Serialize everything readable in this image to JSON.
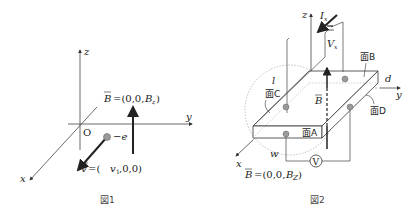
{
  "figure1": {
    "caption": "図1",
    "axes": {
      "x": "x",
      "y": "y",
      "z": "z",
      "origin": "O"
    },
    "field_label": "B=(0,0,B_z)",
    "field_text": "=(0,0,",
    "field_sym": "B",
    "field_sub": "z",
    "charge_label": "−e",
    "velocity_text": "=(",
    "velocity_sym": "v",
    "velocity_v1": "v",
    "velocity_sub": "1",
    "velocity_rest": ",0,0)"
  },
  "figure2": {
    "caption": "図2",
    "axes": {
      "x": "x",
      "y": "y",
      "z": "z",
      "origin": "O"
    },
    "current_label": "I",
    "current_sub": "x",
    "voltage_label": "V",
    "voltage_sub": "x",
    "dimensions": {
      "length": "l",
      "width": "w",
      "thickness": "d"
    },
    "faces": [
      "面A",
      "面B",
      "面C",
      "面D"
    ],
    "field_vec": "B",
    "voltmeter": "V",
    "field_eq_text": "=(0,0,",
    "field_eq_sym": "B",
    "field_eq_sub": "Z"
  },
  "colors": {
    "line": "#333333",
    "arrow": "#222222",
    "dot": "#9a9a9a",
    "dotted": "#888888"
  }
}
